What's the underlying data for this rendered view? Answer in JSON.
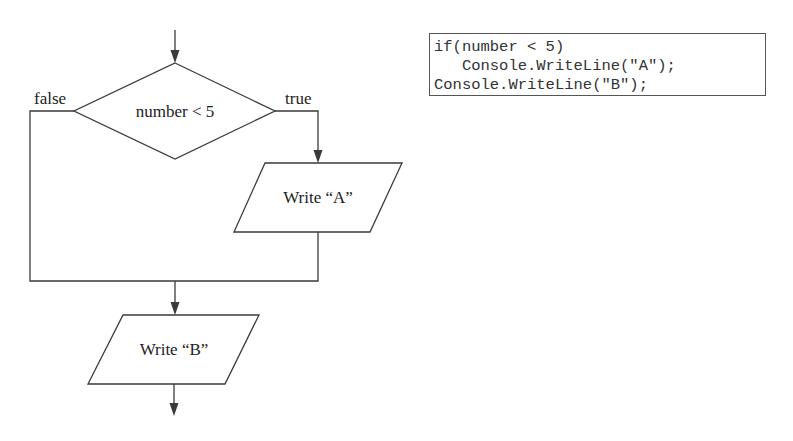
{
  "flowchart": {
    "decision": {
      "label": "number < 5",
      "false_label": "false",
      "true_label": "true"
    },
    "process_a": {
      "label": "Write “A”"
    },
    "process_b": {
      "label": "Write “B”"
    }
  },
  "code": {
    "lines": [
      "if(number < 5)",
      "   Console.WriteLine(\"A\");",
      "Console.WriteLine(\"B\");"
    ]
  },
  "colors": {
    "stroke": "#3a3a3a",
    "text": "#222222",
    "code_text": "#333333",
    "background": "#ffffff"
  }
}
